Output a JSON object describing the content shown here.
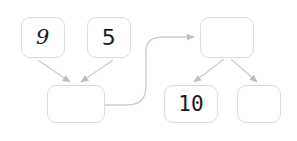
{
  "diagram": {
    "background_color": "#ffffff",
    "node_border_color": "#dcdcdc",
    "edge_color": "#c9c9c9",
    "text_color": "#1b1b1b",
    "nodes": [
      {
        "id": "addend-left",
        "label": "9",
        "style": "italic",
        "x": 21,
        "y": 17,
        "w": 44,
        "h": 41
      },
      {
        "id": "addend-right",
        "label": "5",
        "style": "plain",
        "x": 87,
        "y": 17,
        "w": 44,
        "h": 41
      },
      {
        "id": "sum-left",
        "label": "",
        "style": "plain",
        "x": 47,
        "y": 85,
        "w": 58,
        "h": 38
      },
      {
        "id": "total-top",
        "label": "",
        "style": "plain",
        "x": 200,
        "y": 17,
        "w": 54,
        "h": 41
      },
      {
        "id": "part-left",
        "label": "10",
        "style": "mono",
        "x": 164,
        "y": 85,
        "w": 54,
        "h": 38
      },
      {
        "id": "part-right",
        "label": "",
        "style": "plain",
        "x": 237,
        "y": 85,
        "w": 44,
        "h": 38
      }
    ],
    "edges": [
      {
        "id": "edge-addend-left-to-sum",
        "from": "addend-left",
        "to": "sum-left",
        "kind": "straight-arrow"
      },
      {
        "id": "edge-addend-right-to-sum",
        "from": "addend-right",
        "to": "sum-left",
        "kind": "straight-arrow"
      },
      {
        "id": "edge-sum-to-total",
        "from": "sum-left",
        "to": "total-top",
        "kind": "curved-arrow"
      },
      {
        "id": "edge-total-to-part-left",
        "from": "total-top",
        "to": "part-left",
        "kind": "straight-arrow"
      },
      {
        "id": "edge-total-to-part-right",
        "from": "total-top",
        "to": "part-right",
        "kind": "straight-arrow"
      }
    ]
  }
}
